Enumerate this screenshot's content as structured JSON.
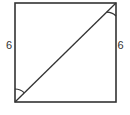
{
  "diagram": {
    "type": "geometry",
    "shape": "square",
    "vertices": {
      "top_left": [
        15,
        3
      ],
      "top_right": [
        116,
        3
      ],
      "bottom_right": [
        116,
        102
      ],
      "bottom_left": [
        15,
        102
      ]
    },
    "diagonal": {
      "from": "bottom_left",
      "to": "top_right"
    },
    "labels": {
      "left_side": "6",
      "right_side": "6"
    },
    "angle_marks": [
      {
        "vertex": "bottom_left",
        "between": [
          "left_side",
          "diagonal"
        ]
      },
      {
        "vertex": "top_right",
        "between": [
          "diagonal",
          "right_side"
        ]
      }
    ],
    "colors": {
      "stroke": "#333333",
      "background": "#ffffff"
    }
  }
}
